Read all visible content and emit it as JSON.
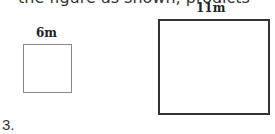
{
  "header": {
    "partial_text": "the figure as shown, prodicts"
  },
  "figures": [
    {
      "id": "small-square",
      "label": "6m"
    },
    {
      "id": "large-rect",
      "label": "11m"
    }
  ],
  "footer": {
    "item_number": "3."
  }
}
